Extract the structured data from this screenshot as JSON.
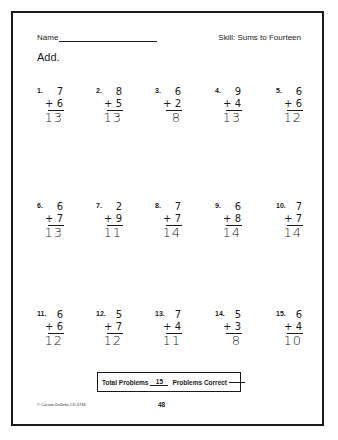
{
  "header": {
    "name_label": "Name",
    "skill": "Skill:  Sums to Fourteen"
  },
  "instruction": "Add.",
  "problems": [
    {
      "label": "1.",
      "top": "7",
      "addend": "+ 6",
      "answer": "13"
    },
    {
      "label": "2.",
      "top": "8",
      "addend": "+ 5",
      "answer": "13"
    },
    {
      "label": "3.",
      "top": "6",
      "addend": "+ 2",
      "answer": "8"
    },
    {
      "label": "4.",
      "top": "9",
      "addend": "+ 4",
      "answer": "13"
    },
    {
      "label": "5.",
      "top": "6",
      "addend": "+ 6",
      "answer": "12"
    },
    {
      "label": "6.",
      "top": "6",
      "addend": "+ 7",
      "answer": "13"
    },
    {
      "label": "7.",
      "top": "2",
      "addend": "+ 9",
      "answer": "11"
    },
    {
      "label": "8.",
      "top": "7",
      "addend": "+ 7",
      "answer": "14"
    },
    {
      "label": "9.",
      "top": "6",
      "addend": "+ 8",
      "answer": "14"
    },
    {
      "label": "10.",
      "top": "7",
      "addend": "+ 7",
      "answer": "14"
    },
    {
      "label": "11.",
      "top": "6",
      "addend": "+ 6",
      "answer": "12"
    },
    {
      "label": "12.",
      "top": "5",
      "addend": "+ 7",
      "answer": "12"
    },
    {
      "label": "13.",
      "top": "7",
      "addend": "+ 4",
      "answer": "11"
    },
    {
      "label": "14.",
      "top": "5",
      "addend": "+ 3",
      "answer": "8"
    },
    {
      "label": "15.",
      "top": "6",
      "addend": "+ 4",
      "answer": "10"
    }
  ],
  "totals": {
    "total_label": "Total Problems",
    "total_value": "15",
    "correct_label": "Problems Correct",
    "correct_value": ""
  },
  "footer": {
    "copyright": "© Carson-Dellosa CD-3746",
    "page_number": "48"
  }
}
